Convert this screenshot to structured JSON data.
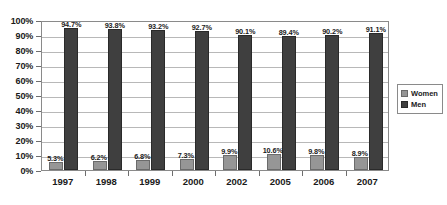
{
  "chart_data": {
    "type": "bar",
    "title": "",
    "subtitle": "",
    "xlabel": "",
    "ylabel": "",
    "categories": [
      "1997",
      "1998",
      "1999",
      "2000",
      "2002",
      "2005",
      "2006",
      "2007"
    ],
    "series": [
      {
        "name": "Women",
        "color": "#969696",
        "values": [
          5.3,
          6.2,
          6.8,
          7.3,
          9.9,
          10.6,
          9.8,
          8.9
        ],
        "labels": [
          "5.3%",
          "6.2%",
          "6.8%",
          "7.3%",
          "9.9%",
          "10.6%",
          "9.8%",
          "8.9%"
        ]
      },
      {
        "name": "Men",
        "color": "#3f3f3f",
        "values": [
          94.7,
          93.8,
          93.2,
          92.7,
          90.1,
          89.4,
          90.2,
          91.1
        ],
        "labels": [
          "94.7%",
          "93.8%",
          "93.2%",
          "92.7%",
          "90.1%",
          "89.4%",
          "90.2%",
          "91.1%"
        ]
      }
    ],
    "ylim": [
      0,
      100
    ],
    "ytick_values": [
      0,
      10,
      20,
      30,
      40,
      50,
      60,
      70,
      80,
      90,
      100
    ],
    "ytick_labels": [
      "0%",
      "10%",
      "20%",
      "30%",
      "40%",
      "50%",
      "60%",
      "70%",
      "80%",
      "90%",
      "100%"
    ],
    "grid": true,
    "grid_axis": "y",
    "legend_position": "right",
    "legend_entries": [
      "Women",
      "Men"
    ],
    "plot_background": "#ffffff",
    "border_color": "#8a8a8a"
  }
}
